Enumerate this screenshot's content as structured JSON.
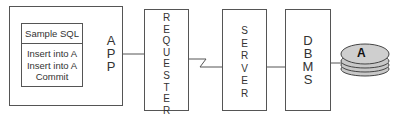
{
  "diagram": {
    "app": {
      "label_letters": [
        "A",
        "P",
        "P"
      ],
      "sql_box": {
        "title": "Sample SQL",
        "lines": [
          "Insert into A",
          "Insert into A",
          "Commit"
        ]
      }
    },
    "requester": {
      "label_letters": [
        "R",
        "E",
        "Q",
        "U",
        "E",
        "S",
        "T",
        "E",
        "R"
      ]
    },
    "server": {
      "label_letters": [
        "S",
        "E",
        "R",
        "V",
        "E",
        "R"
      ]
    },
    "dbms": {
      "label_letters": [
        "D",
        "B",
        "M",
        "S"
      ]
    },
    "database": {
      "label": "A"
    },
    "connectors": [
      {
        "from": "APP",
        "to": "REQUESTER",
        "style": "line"
      },
      {
        "from": "REQUESTER",
        "to": "SERVER",
        "style": "lightning"
      },
      {
        "from": "SERVER",
        "to": "DBMS",
        "style": "line"
      },
      {
        "from": "DBMS",
        "to": "A",
        "style": "line"
      }
    ],
    "colors": {
      "stroke": "#555555",
      "disk_fill": "#c8c8c8",
      "background": "#ffffff"
    }
  }
}
